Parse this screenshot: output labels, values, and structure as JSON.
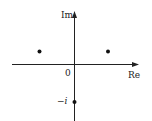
{
  "diagram": {
    "type": "complex-plane",
    "axes": {
      "horizontal_label": "Re",
      "vertical_label": "Im",
      "origin_label": "0"
    },
    "points": [
      {
        "name": "upper-left-point",
        "label": "",
        "x": 39.5,
        "y": 51.5
      },
      {
        "name": "upper-right-point",
        "label": "",
        "x": 108,
        "y": 51.5
      },
      {
        "name": "neg-i-point",
        "label": "−i",
        "x": 74.5,
        "y": 102
      }
    ],
    "tick_labels": {
      "neg_i": "−i"
    },
    "colors": {
      "axis": "#222222",
      "point": "#111111",
      "background": "#ffffff"
    }
  }
}
